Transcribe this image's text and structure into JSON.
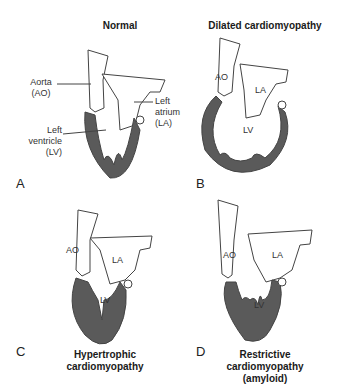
{
  "colors": {
    "myocardium": "#5a5a5a",
    "outline": "#444444",
    "background": "#ffffff"
  },
  "panels": [
    {
      "letter": "A",
      "title": "Normal",
      "labels": {
        "aorta": "Aorta\n(AO)",
        "atrium": "Left\natrium\n(LA)",
        "ventricle": "Left\nventricle\n(LV)"
      }
    },
    {
      "letter": "B",
      "title": "Dilated cardiomyopathy",
      "labels": {
        "ao": "AO",
        "la": "LA",
        "lv": "LV"
      }
    },
    {
      "letter": "C",
      "title": "Hypertrophic\ncardiomyopathy",
      "labels": {
        "ao": "AO",
        "la": "LA",
        "lv": "LV"
      }
    },
    {
      "letter": "D",
      "title": "Restrictive\ncardiomyopathy\n(amyloid)",
      "labels": {
        "ao": "AO",
        "la": "LA",
        "lv": "LV"
      }
    }
  ]
}
